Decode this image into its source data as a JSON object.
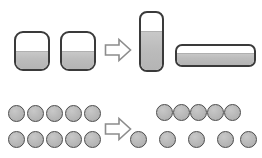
{
  "figure": {
    "background_color": "#ffffff",
    "width": 262,
    "height": 158,
    "stroke_color": "#3a3a3a",
    "liquid_color": "#bcbcbc",
    "token_fill_color": "#b6b6b6",
    "token_stroke_color": "#4a4a4a",
    "arrow_stroke_color": "#8c8c8c",
    "arrow_fill_color": "#ffffff"
  },
  "rows": [
    {
      "id": "liquid-conservation-row",
      "label": "Liquid volume conservation",
      "before": {
        "label": "Two identical wide beakers, equal level",
        "vessels": [
          {
            "name": "beaker-left",
            "shape": "rounded-square",
            "x": 14,
            "y": 31,
            "width": 36,
            "height": 40,
            "radius": 9,
            "fill_percent": 50
          },
          {
            "name": "beaker-right",
            "shape": "rounded-square",
            "x": 60,
            "y": 31,
            "width": 36,
            "height": 40,
            "radius": 9,
            "fill_percent": 50
          }
        ]
      },
      "arrow": {
        "name": "transform-arrow-liquid",
        "x": 104,
        "y": 37,
        "width": 28,
        "height": 26,
        "direction": "right"
      },
      "after": {
        "label": "Tall narrow vessel and wide flat vessel, same volume",
        "vessels": [
          {
            "name": "tall-narrow-vessel",
            "shape": "rounded-rect-tall",
            "x": 139,
            "y": 11,
            "width": 25,
            "height": 61,
            "radius": 8,
            "fill_percent": 68
          },
          {
            "name": "wide-flat-vessel",
            "shape": "rounded-rect-wide",
            "x": 175,
            "y": 44,
            "width": 81,
            "height": 23,
            "radius": 7,
            "fill_percent": 62
          }
        ]
      }
    },
    {
      "id": "number-conservation-row",
      "label": "Number conservation",
      "before": {
        "label": "Two rows of five tokens, aligned one-to-one",
        "token_diameter": 17,
        "rows": [
          {
            "name": "token-row-top-left",
            "y": 105,
            "xs": [
              8,
              27,
              46,
              65,
              84
            ]
          },
          {
            "name": "token-row-bottom-left",
            "y": 131,
            "xs": [
              8,
              27,
              46,
              65,
              84
            ]
          }
        ]
      },
      "arrow": {
        "name": "transform-arrow-number",
        "x": 104,
        "y": 116,
        "width": 28,
        "height": 26,
        "direction": "right"
      },
      "after": {
        "label": "Top row compressed, bottom row spread out; counts still equal",
        "token_diameter": 17,
        "rows": [
          {
            "name": "token-row-top-right",
            "y": 104,
            "xs": [
              156,
              173,
              190,
              207,
              224
            ]
          },
          {
            "name": "token-row-bottom-right",
            "y": 131,
            "xs": [
              130,
              159,
              188,
              217,
              240
            ]
          }
        ]
      }
    }
  ]
}
